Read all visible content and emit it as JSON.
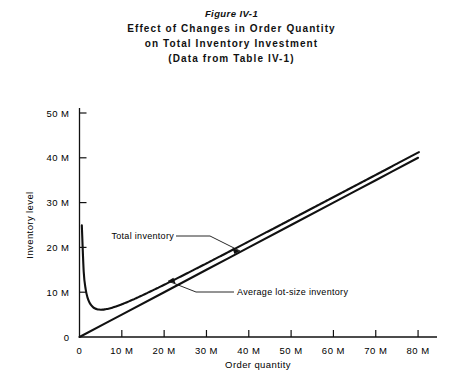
{
  "figure": {
    "number_label": "Figure IV-1",
    "title_line1": "Effect of Changes in Order Quantity",
    "title_line2": "on Total Inventory Investment",
    "title_line3": "(Data from Table IV-1)"
  },
  "axes": {
    "x_label": "Order quantity",
    "y_label": "Inventory level",
    "x_ticks": [
      "0",
      "10 M",
      "20 M",
      "30 M",
      "40 M",
      "50 M",
      "60 M",
      "70 M",
      "80 M"
    ],
    "y_ticks": [
      "0",
      "10 M",
      "20 M",
      "30 M",
      "40 M",
      "50 M"
    ]
  },
  "annotations": {
    "total_inventory": "Total inventory",
    "average_lot_size": "Average lot-size inventory"
  },
  "colors": {
    "ink": "#111111",
    "background": "#ffffff"
  },
  "chart_data": {
    "type": "line",
    "title": "Effect of Changes in Order Quantity on Total Inventory Investment",
    "subtitle": "(Data from Table IV-1)",
    "xlabel": "Order quantity",
    "ylabel": "Inventory level",
    "xlim": [
      0,
      84
    ],
    "ylim": [
      0,
      53
    ],
    "x_unit": "M",
    "y_unit": "M",
    "x_ticks": [
      0,
      10,
      20,
      30,
      40,
      50,
      60,
      70,
      80
    ],
    "y_ticks": [
      0,
      10,
      20,
      30,
      40,
      50
    ],
    "grid": false,
    "legend": "inline annotations with leader lines",
    "series": [
      {
        "name": "Total inventory",
        "note": "U-shaped curve; minimum about 6 M at order quantity near 4 M; converges toward the average lot-size line at large order quantities",
        "x": [
          0.6,
          1,
          1.5,
          2,
          3,
          4,
          5,
          6,
          8,
          10,
          12,
          15,
          20,
          25,
          30,
          35,
          40,
          45,
          50,
          55,
          60,
          65,
          70,
          75,
          80
        ],
        "y": [
          13.6,
          10.6,
          8.6,
          7.6,
          6.4,
          6.1,
          6.2,
          6.5,
          7.5,
          8.7,
          10.0,
          11.9,
          15.2,
          18.4,
          21.6,
          24.7,
          27.8,
          30.9,
          34.0,
          37.0,
          40.0,
          34.5,
          37.0,
          39.5,
          41.2
        ],
        "y_at_ticks": {
          "10": 8.7,
          "20": 15.2,
          "30": 21.6,
          "40": 27.8,
          "50": 34.0,
          "60": 40.0,
          "70": 37.0,
          "80": 41.2
        }
      },
      {
        "name": "Average lot-size inventory",
        "note": "straight line through the origin, slope one half of order quantity",
        "x": [
          0,
          10,
          20,
          30,
          40,
          50,
          60,
          70,
          80
        ],
        "y": [
          0,
          5.0,
          10.0,
          15.0,
          20.0,
          25.0,
          30.0,
          35.0,
          40.0
        ]
      }
    ],
    "annotations": [
      {
        "text": "Total inventory",
        "x": 10,
        "y": 17.5,
        "points_to": {
          "x": 23,
          "y": 15.5
        }
      },
      {
        "text": "Average lot-size inventory",
        "x": 33,
        "y": 7.5,
        "points_to": {
          "x": 20,
          "y": 10.0
        }
      }
    ]
  }
}
